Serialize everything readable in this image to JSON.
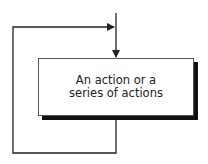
{
  "diagram": {
    "type": "loop-flowchart",
    "box": {
      "line1": "An action or a",
      "line2": "series of actions"
    },
    "colors": {
      "line": "#222222",
      "shadow": "#111111",
      "box_border": "#555555",
      "background": "#ffffff"
    }
  }
}
